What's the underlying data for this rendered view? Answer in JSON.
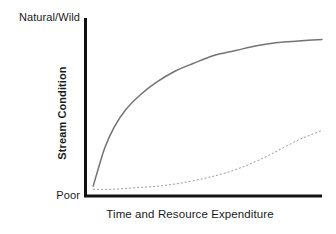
{
  "chart_data": {
    "type": "line",
    "title": "",
    "xlabel": "Time and Resource Expenditure",
    "ylabel": "Stream Condition",
    "grid": false,
    "legend": "none",
    "axis_style": "open-L (left and bottom spines only)",
    "xlim": [
      0,
      100
    ],
    "ylim": [
      0,
      100
    ],
    "xticks": [],
    "yticks": [
      0,
      100
    ],
    "ytick_labels": [
      "Poor",
      "Natural/Wild"
    ],
    "annotations": [],
    "series": [
      {
        "name": "saturating-curve",
        "style": "solid",
        "color": "#737373",
        "linewidth": 1.5,
        "shape": "concave-down saturating (logarithmic)",
        "x": [
          2,
          4,
          7,
          11,
          16,
          22,
          29,
          37,
          45,
          54,
          63,
          72,
          81,
          90,
          100
        ],
        "y": [
          4,
          14,
          28,
          41,
          52,
          61,
          69,
          76,
          81,
          86,
          89,
          92,
          94,
          95,
          96
        ]
      },
      {
        "name": "accelerating-curve",
        "style": "dashed",
        "color": "#9a9a9a",
        "linewidth": 1,
        "dash_pattern": [
          2,
          2
        ],
        "shape": "convex accelerating (exponential)",
        "x": [
          2,
          10,
          20,
          30,
          40,
          50,
          58,
          66,
          74,
          82,
          90,
          95,
          100
        ],
        "y": [
          2,
          2,
          3,
          4,
          6,
          9,
          12,
          16,
          21,
          27,
          33,
          36,
          39
        ]
      }
    ]
  },
  "labels": {
    "top_value": "Natural/Wild",
    "bottom_value": "Poor",
    "y_axis_title": "Stream Condition",
    "x_axis_title": "Time and Resource Expenditure"
  },
  "colors": {
    "background": "#ffffff",
    "axis": "#111111",
    "text": "#1a1a1a",
    "solid_curve": "#737373",
    "dashed_curve": "#9a9a9a"
  }
}
